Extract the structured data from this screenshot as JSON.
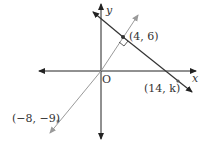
{
  "diagram": {
    "axes": {
      "x_label": "x",
      "y_label": "y",
      "origin_label": "O"
    },
    "points": [
      {
        "id": "p1",
        "label": "(4, 6)",
        "x": 4,
        "y": 6
      },
      {
        "id": "p2",
        "label": "(14, k)",
        "x": 14,
        "y": "k"
      },
      {
        "id": "p3",
        "label": "(−8, −9)",
        "x": -8,
        "y": -9
      }
    ],
    "lines": [
      {
        "id": "line-gray",
        "through": [
          "(−8, −9)",
          "O",
          "(4, 6)"
        ],
        "color": "#9a9a9a"
      },
      {
        "id": "line-dark",
        "through": [
          "(4, 6)",
          "(14, k)"
        ],
        "color": "#333333"
      }
    ],
    "annotations": {
      "right_angle_at": "(4, 6)"
    }
  }
}
